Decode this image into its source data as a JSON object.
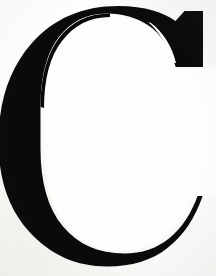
{
  "image": {
    "kind": "scanned-letterform",
    "character": "C",
    "case": "uppercase",
    "style": "serif",
    "description": "Large black serif capital letter C on a white background",
    "width": 216,
    "height": 276,
    "alt_text": "C"
  },
  "colors": {
    "background": "#fdfdfc",
    "paper_shade": "#f9f8f6",
    "glyph": "#0a0a0a",
    "glyph_edge": "#151515"
  },
  "glyph": {
    "name": "letter-c",
    "label": "C",
    "fill": "#0a0a0a",
    "bounds": {
      "x": 11,
      "y": 12,
      "width": 192,
      "height": 246
    },
    "stroke_weight_max": 50,
    "stroke_weight_min": 17,
    "terminals": {
      "upper_right": "concave-beak-serif",
      "lower_right": "angled-cut"
    },
    "aperture": {
      "side": "right",
      "top": 110,
      "bottom": 196
    },
    "counter": {
      "x": 62,
      "y": 40,
      "width": 130,
      "height": 190
    },
    "outline_path": "M 203 14 L 203 64 L 178 64 C 172 46 163 33 151 25 C 139 17 125 13 109 13 C 87 13 70 21 57 38 C 44 55 37 79 37 110 L 37 142 C 37 177 45 204 60 223 C 76 242 97 252 124 252 C 142 252 158 247 171 237 C 184 227 194 212 201 192 L 203 196 C 196 217 185 234 169 246 C 153 258 134 264 111 264 C 81 264 55 253 35 231 C 15 209 5 180 5 144 C 5 104 16 72 37 48 C 58 24 86 12 120 12 C 132 12 143 13 153 16 C 163 19 171 23 178 28 L 186 14 Z"
  }
}
